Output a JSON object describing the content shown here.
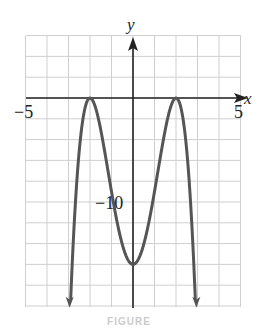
{
  "chart_data": {
    "type": "line",
    "title": "",
    "xlabel": "x",
    "ylabel": "y",
    "xlim": [
      -5,
      5
    ],
    "ylim": [
      -20,
      6
    ],
    "x_ticks_labeled": [
      -5,
      5
    ],
    "y_ticks_labeled": [
      -10
    ],
    "x_grid_step": 1,
    "y_grid_step": 2,
    "grid": true,
    "legend": null,
    "series": [
      {
        "name": "f(x) = -(x^2 - 4)^2",
        "color": "#555555",
        "ends_with_arrows": true,
        "points": [
          {
            "x": -2.9,
            "y": -19.4
          },
          {
            "x": -2.5,
            "y": -5.06
          },
          {
            "x": -2,
            "y": 0
          },
          {
            "x": -1.5,
            "y": -3.06
          },
          {
            "x": -1,
            "y": -9
          },
          {
            "x": -0.5,
            "y": -14.06
          },
          {
            "x": 0,
            "y": -16
          },
          {
            "x": 0.5,
            "y": -14.06
          },
          {
            "x": 1,
            "y": -9
          },
          {
            "x": 1.5,
            "y": -3.06
          },
          {
            "x": 2,
            "y": 0
          },
          {
            "x": 2.5,
            "y": -5.06
          },
          {
            "x": 2.9,
            "y": -19.4
          }
        ]
      }
    ],
    "annotations": [
      {
        "text": "-5",
        "at": "x-axis left end"
      },
      {
        "text": "5",
        "at": "x-axis right end"
      },
      {
        "text": "-10",
        "at": "y-axis"
      }
    ]
  },
  "labels": {
    "x_axis": "x",
    "y_axis": "y",
    "x_min": "−5",
    "x_max": "5",
    "y_tick": "−10"
  },
  "caption": "FIGURE"
}
